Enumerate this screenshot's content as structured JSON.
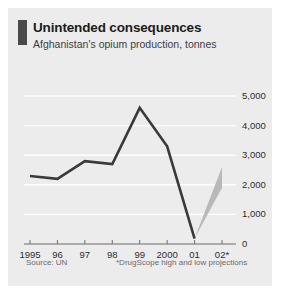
{
  "figure": {
    "accent_color": "#4a4a4c",
    "panel_color": "#ececed",
    "line_color": "#3a3a3c",
    "projection_color": "#b9b9bb"
  },
  "header": {
    "title": "Unintended consequences",
    "subtitle": "Afghanistan's opium production, tonnes"
  },
  "footer": {
    "source": "Source: UN",
    "note": "*DrugScope high and low projections"
  },
  "chart_data": {
    "type": "line",
    "title": "Unintended consequences",
    "subtitle": "Afghanistan's opium production, tonnes",
    "xlabel": "",
    "ylabel": "tonnes",
    "categories": [
      "1995",
      "96",
      "97",
      "98",
      "99",
      "2000",
      "01",
      "02*"
    ],
    "x": [
      1995,
      1996,
      1997,
      1998,
      1999,
      2000,
      2001,
      2002
    ],
    "series": [
      {
        "name": "Opium production",
        "values": [
          2300,
          2200,
          2800,
          2700,
          4600,
          3300,
          185,
          null
        ]
      }
    ],
    "projection": {
      "name": "DrugScope high and low projections",
      "year": "02*",
      "from_year": "01",
      "from_value": 185,
      "high": 2600,
      "low": 1900
    },
    "yticks": [
      0,
      1000,
      2000,
      3000,
      4000,
      5000
    ],
    "yticklabels": [
      "0",
      "1,000",
      "2,000",
      "3,000",
      "4,000",
      "5,000"
    ],
    "ylim": [
      0,
      5000
    ],
    "grid": true,
    "grid_color": "#ffffff",
    "legend": false,
    "annotations": [
      "*DrugScope high and low projections"
    ]
  }
}
